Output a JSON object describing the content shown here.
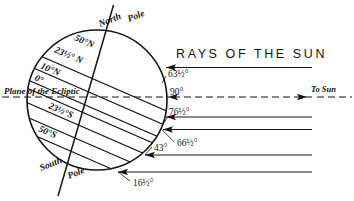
{
  "figure": {
    "title": "RAYS OF THE SUN",
    "to_sun_label": "To Sun",
    "ecliptic_label": "Plane of the Ecliptic",
    "north_pole_label_a": "North",
    "north_pole_label_b": "Pole",
    "south_pole_label_a": "South",
    "south_pole_label_b": "Pole"
  },
  "latitudes": [
    {
      "label": "50°N",
      "name": "lat-50n"
    },
    {
      "label": "23½° N",
      "name": "lat-23-5n"
    },
    {
      "label": "10°N",
      "name": "lat-10n"
    },
    {
      "label": "0°",
      "name": "lat-equator"
    },
    {
      "label": "23½°S",
      "name": "lat-23-5s"
    },
    {
      "label": "50°S",
      "name": "lat-50s"
    }
  ],
  "incidence_angles": [
    {
      "label": "63½°",
      "name": "angle-63-5"
    },
    {
      "label": "90°",
      "name": "angle-90"
    },
    {
      "label": "76½°",
      "name": "angle-76-5"
    },
    {
      "label": "66½°",
      "name": "angle-66-5"
    },
    {
      "label": "43°",
      "name": "angle-43"
    },
    {
      "label": "16½°",
      "name": "angle-16-5"
    }
  ],
  "colors": {
    "ink": "#141414",
    "background": "#ffffff"
  },
  "geometry": {
    "globe_center_x": 97,
    "globe_center_y": 100,
    "globe_radius": 70,
    "axis_tilt_degrees": 23.5,
    "parallel_slope_degrees": 23.5,
    "ray_right_edge_x": 312
  }
}
